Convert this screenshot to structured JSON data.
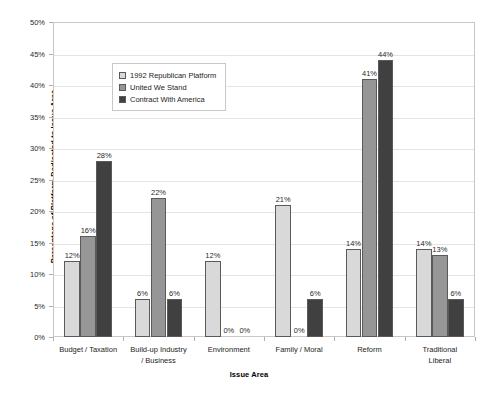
{
  "chart_data": {
    "type": "bar",
    "title": "",
    "xlabel": "Issue Area",
    "ylabel": "Percentage of Platform Dedicated to Issue Area",
    "ylim": [
      0,
      50
    ],
    "ytick_labels": [
      "0%",
      "5%",
      "10%",
      "15%",
      "20%",
      "25%",
      "30%",
      "35%",
      "40%",
      "45%",
      "50%"
    ],
    "ytick_values": [
      0,
      5,
      10,
      15,
      20,
      25,
      30,
      35,
      40,
      45,
      50
    ],
    "grid": true,
    "legend_position": "upper-left-inside",
    "categories": [
      "Budget / Taxation",
      "Build-up Industry / Business",
      "Environment",
      "Family / Moral",
      "Reform",
      "Traditional Liberal"
    ],
    "category_lines": [
      [
        "Budget / Taxation"
      ],
      [
        "Build-up Industry",
        "/ Business"
      ],
      [
        "Environment"
      ],
      [
        "Family / Moral"
      ],
      [
        "Reform"
      ],
      [
        "Traditional",
        "Liberal"
      ]
    ],
    "series": [
      {
        "name": "1992 Republican Platform",
        "color": "#d9d9d9",
        "values": [
          12,
          6,
          12,
          21,
          14,
          14
        ],
        "labels": [
          "12%",
          "6%",
          "12%",
          "21%",
          "14%",
          "14%"
        ]
      },
      {
        "name": "United We Stand",
        "color": "#969696",
        "values": [
          16,
          22,
          0,
          0,
          41,
          13
        ],
        "labels": [
          "16%",
          "22%",
          "0%",
          "0%",
          "41%",
          "13%"
        ]
      },
      {
        "name": "Contract With America",
        "color": "#404040",
        "values": [
          28,
          6,
          0,
          6,
          44,
          6
        ],
        "labels": [
          "28%",
          "6%",
          "0%",
          "6%",
          "44%",
          "6%"
        ]
      }
    ]
  }
}
